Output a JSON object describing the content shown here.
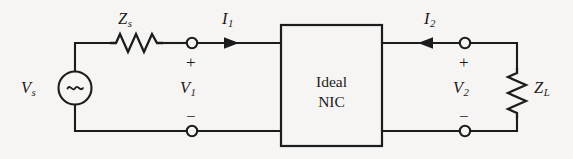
{
  "figure": {
    "kind": "circuit-schematic",
    "background_color": "#f6f5f3",
    "ink_color": "#1c1c1c"
  },
  "components": {
    "source": {
      "name": "voltage-source",
      "label": "V",
      "subscript": "s",
      "symbol": "~",
      "type": "ac-sinusoidal"
    },
    "source_impedance": {
      "name": "source-impedance-resistor",
      "label": "Z",
      "subscript": "s",
      "orientation": "horizontal"
    },
    "load_impedance": {
      "name": "load-impedance-resistor",
      "label": "Z",
      "subscript": "L",
      "orientation": "vertical"
    },
    "nic_block": {
      "name": "ideal-nic-block",
      "line1": "Ideal",
      "line2": "NIC"
    }
  },
  "ports": {
    "input": {
      "voltage": {
        "label": "V",
        "subscript": "1"
      },
      "current": {
        "label": "I",
        "subscript": "1",
        "arrow_direction": "right"
      },
      "plus_sign": "+",
      "minus_sign": "−"
    },
    "output": {
      "voltage": {
        "label": "V",
        "subscript": "2"
      },
      "current": {
        "label": "I",
        "subscript": "2",
        "arrow_direction": "left"
      },
      "plus_sign": "+",
      "minus_sign": "−"
    }
  }
}
